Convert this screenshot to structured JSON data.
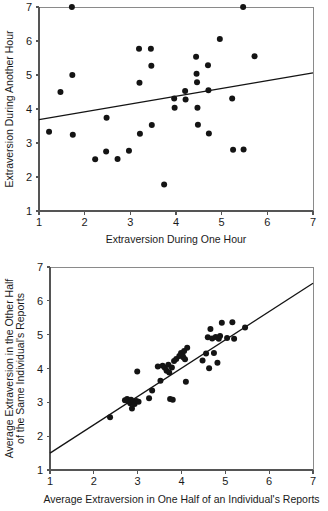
{
  "chart_data": [
    {
      "id": "top",
      "type": "scatter",
      "title": "",
      "xlabel": "Extraversion During One Hour",
      "ylabel": "Extraversion During Another Hour",
      "xlim": [
        1,
        7
      ],
      "ylim": [
        1,
        7
      ],
      "xticks": [
        1,
        2,
        3,
        4,
        5,
        6,
        7
      ],
      "yticks": [
        1,
        2,
        3,
        4,
        5,
        6,
        7
      ],
      "xticklabels": [
        "1",
        "2",
        "3",
        "4",
        "5",
        "6",
        "7"
      ],
      "yticklabels": [
        "1",
        "2",
        "3",
        "4",
        "5",
        "6",
        "7"
      ],
      "grid": false,
      "legend": null,
      "marker_color": "#141414",
      "marker_size_px": 6,
      "fit_line": {
        "type": "linear-regression",
        "x": [
          1.0,
          7.0
        ],
        "y": [
          3.69,
          5.06
        ],
        "color": "#141414"
      },
      "points": [
        [
          1.22,
          3.33
        ],
        [
          1.47,
          4.5
        ],
        [
          1.72,
          7.0
        ],
        [
          1.73,
          5.0
        ],
        [
          1.74,
          3.24
        ],
        [
          2.23,
          2.52
        ],
        [
          2.47,
          2.75
        ],
        [
          2.48,
          3.74
        ],
        [
          2.72,
          2.53
        ],
        [
          2.97,
          2.77
        ],
        [
          3.19,
          5.77
        ],
        [
          3.2,
          4.77
        ],
        [
          3.21,
          3.27
        ],
        [
          3.45,
          5.77
        ],
        [
          3.46,
          5.27
        ],
        [
          3.47,
          3.53
        ],
        [
          3.74,
          1.78
        ],
        [
          3.96,
          4.31
        ],
        [
          3.97,
          4.04
        ],
        [
          4.2,
          4.53
        ],
        [
          4.21,
          4.28
        ],
        [
          4.44,
          5.54
        ],
        [
          4.45,
          5.04
        ],
        [
          4.46,
          4.79
        ],
        [
          4.47,
          4.04
        ],
        [
          4.48,
          3.54
        ],
        [
          4.7,
          5.29
        ],
        [
          4.71,
          4.55
        ],
        [
          4.72,
          3.28
        ],
        [
          4.96,
          6.06
        ],
        [
          5.23,
          4.31
        ],
        [
          5.25,
          2.8
        ],
        [
          5.47,
          7.0
        ],
        [
          5.48,
          2.81
        ],
        [
          5.72,
          5.55
        ]
      ]
    },
    {
      "id": "bottom",
      "type": "scatter",
      "title": "",
      "xlabel": "Average Extraversion in One Half of an Individual's Reports",
      "ylabel": "Average Extraversion in the Other Half of the Same Individual's Reports",
      "ylabel_lines": [
        "Average Extraversion in the Other Half",
        "of the Same Individual's Reports"
      ],
      "xlim": [
        1,
        7
      ],
      "ylim": [
        1,
        7
      ],
      "xticks": [
        1,
        2,
        3,
        4,
        5,
        6,
        7
      ],
      "yticks": [
        1,
        2,
        3,
        4,
        5,
        6,
        7
      ],
      "xticklabels": [
        "1",
        "2",
        "3",
        "4",
        "5",
        "6",
        "7"
      ],
      "yticklabels": [
        "1",
        "2",
        "3",
        "4",
        "5",
        "6",
        "7"
      ],
      "grid": false,
      "legend": null,
      "marker_color": "#141414",
      "marker_size_px": 6,
      "fit_line": {
        "type": "linear-regression",
        "x": [
          1.0,
          7.0
        ],
        "y": [
          1.5,
          6.52
        ],
        "color": "#141414"
      },
      "points": [
        [
          2.37,
          2.56
        ],
        [
          2.71,
          3.06
        ],
        [
          2.76,
          3.1
        ],
        [
          2.79,
          3.04
        ],
        [
          2.83,
          2.97
        ],
        [
          2.85,
          3.08
        ],
        [
          2.87,
          2.82
        ],
        [
          2.9,
          3.01
        ],
        [
          2.93,
          2.95
        ],
        [
          2.97,
          3.04
        ],
        [
          2.99,
          3.91
        ],
        [
          3.02,
          3.02
        ],
        [
          3.26,
          3.12
        ],
        [
          3.33,
          3.35
        ],
        [
          3.46,
          4.06
        ],
        [
          3.52,
          3.64
        ],
        [
          3.57,
          4.08
        ],
        [
          3.62,
          4.02
        ],
        [
          3.66,
          3.93
        ],
        [
          3.7,
          4.11
        ],
        [
          3.72,
          3.88
        ],
        [
          3.74,
          3.1
        ],
        [
          3.78,
          4.03
        ],
        [
          3.8,
          3.08
        ],
        [
          3.83,
          4.22
        ],
        [
          3.88,
          4.28
        ],
        [
          3.95,
          4.37
        ],
        [
          3.99,
          4.46
        ],
        [
          4.02,
          4.41
        ],
        [
          4.04,
          4.33
        ],
        [
          4.06,
          4.52
        ],
        [
          4.08,
          4.27
        ],
        [
          4.1,
          3.61
        ],
        [
          4.13,
          4.61
        ],
        [
          4.48,
          4.24
        ],
        [
          4.56,
          4.44
        ],
        [
          4.6,
          4.92
        ],
        [
          4.63,
          4.01
        ],
        [
          4.66,
          5.17
        ],
        [
          4.7,
          4.89
        ],
        [
          4.74,
          4.46
        ],
        [
          4.78,
          4.93
        ],
        [
          4.82,
          4.17
        ],
        [
          4.85,
          4.88
        ],
        [
          4.88,
          4.96
        ],
        [
          4.92,
          5.35
        ],
        [
          5.04,
          4.9
        ],
        [
          5.16,
          5.37
        ],
        [
          5.2,
          4.88
        ],
        [
          5.45,
          5.21
        ]
      ]
    }
  ]
}
